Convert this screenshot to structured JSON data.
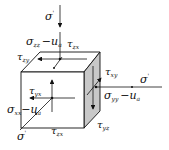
{
  "diagram": {
    "colors": {
      "line": "#111111",
      "side_face": "#c8c8c8",
      "faces": "#ffffff"
    },
    "labels": {
      "top_load": "σ'",
      "top_normal": "σzz − ua",
      "top_shear_x": "τzx",
      "top_shear_y": "τzy",
      "right_load": "σ'",
      "right_normal": "σyy − ua",
      "right_shear_z": "τyz",
      "right_shear_x": "τxy",
      "front_load": "σ'",
      "front_normal": "σxx − ua",
      "front_shear_y": "τyx",
      "front_shear_z": "τzx_bottom"
    },
    "text": {
      "sigma": "σ",
      "tau": "τ",
      "prime": "'",
      "minus_ua": "−u",
      "a": "a",
      "zz": "zz",
      "yy": "yy",
      "xx": "xx",
      "zx": "zx",
      "zy": "zy",
      "xy": "xy",
      "yx": "yx",
      "yz": "yz"
    }
  }
}
